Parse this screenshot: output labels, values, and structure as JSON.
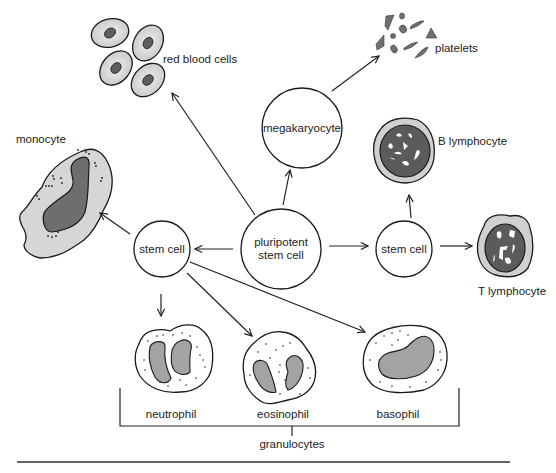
{
  "nodes": {
    "pluripotent": {
      "line1": "pluripotent",
      "line2": "stem cell"
    },
    "megakaryocyte": {
      "label": "megakaryocyte"
    },
    "stem_cell_left": {
      "label": "stem cell"
    },
    "stem_cell_right": {
      "label": "stem cell"
    }
  },
  "cells": {
    "red_blood_cells": "red blood cells",
    "platelets": "platelets",
    "monocyte": "monocyte",
    "b_lymphocyte": "B lymphocyte",
    "t_lymphocyte": "T lymphocyte",
    "neutrophil": "neutrophil",
    "eosinophil": "eosinophil",
    "basophil": "basophil"
  },
  "groups": {
    "granulocytes": "granulocytes"
  },
  "edges": [
    {
      "from": "pluripotent stem cell",
      "to": "red blood cells"
    },
    {
      "from": "pluripotent stem cell",
      "to": "megakaryocyte"
    },
    {
      "from": "megakaryocyte",
      "to": "platelets"
    },
    {
      "from": "pluripotent stem cell",
      "to": "stem cell (myeloid)"
    },
    {
      "from": "pluripotent stem cell",
      "to": "stem cell (lymphoid)"
    },
    {
      "from": "stem cell (lymphoid)",
      "to": "B lymphocyte"
    },
    {
      "from": "stem cell (lymphoid)",
      "to": "T lymphocyte"
    },
    {
      "from": "stem cell (myeloid)",
      "to": "monocyte"
    },
    {
      "from": "stem cell (myeloid)",
      "to": "neutrophil"
    },
    {
      "from": "stem cell (myeloid)",
      "to": "eosinophil"
    },
    {
      "from": "stem cell (myeloid)",
      "to": "basophil"
    }
  ],
  "colors": {
    "cytoplasm_light": "#d9d9d9",
    "rbc_fill": "#dcdcdc",
    "nucleus_dark": "#6e6e6e",
    "nucleus_mid": "#9a9a9a",
    "platelet": "#6f6f6f",
    "outline": "#1a1a1a"
  }
}
